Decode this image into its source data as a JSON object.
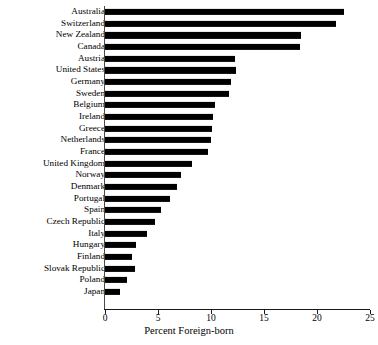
{
  "chart_data": {
    "type": "bar",
    "orientation": "horizontal",
    "title": "",
    "subtitle": "",
    "xlabel": "Percent Foreign-born",
    "ylabel": "",
    "xlim": [
      0,
      25
    ],
    "xticks": [
      0,
      5,
      10,
      15,
      20,
      25
    ],
    "grid": false,
    "legend": null,
    "bar_color": "#000000",
    "categories": [
      "Australia",
      "Switzerland",
      "New Zealand",
      "Canada",
      "Austria",
      "United States",
      "Germany",
      "Sweden",
      "Belgium",
      "Ireland",
      "Greece",
      "Netherlands",
      "France",
      "United Kingdom",
      "Norway",
      "Denmark",
      "Portugal",
      "Spain",
      "Czech Republic",
      "Italy",
      "Hungary",
      "Finland",
      "Slovak Republic",
      "Poland",
      "Japan"
    ],
    "values": [
      22.5,
      21.8,
      18.5,
      18.4,
      12.3,
      12.4,
      11.9,
      11.7,
      10.4,
      10.2,
      10.1,
      10.0,
      9.7,
      8.2,
      7.2,
      6.8,
      6.1,
      5.3,
      4.7,
      4.0,
      2.9,
      2.5,
      2.8,
      2.1,
      1.4
    ]
  }
}
